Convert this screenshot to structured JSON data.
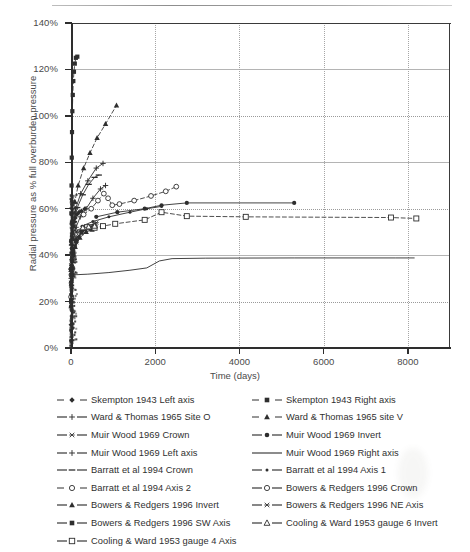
{
  "chart_data": {
    "type": "line",
    "title": "",
    "xlabel": "Time (days)",
    "ylabel": "Radial pressure as % full overburden pressure",
    "xlim": [
      0,
      9000
    ],
    "ylim": [
      0,
      1.4
    ],
    "xticks": [
      "0",
      "2000",
      "4000",
      "6000",
      "8000"
    ],
    "xtick_values": [
      0,
      2000,
      4000,
      6000,
      8000
    ],
    "yticks": [
      "0%",
      "20%",
      "40%",
      "60%",
      "80%",
      "100%",
      "120%",
      "140%"
    ],
    "ytick_values": [
      0,
      0.2,
      0.4,
      0.6,
      0.8,
      1.0,
      1.2,
      1.4
    ],
    "grid": "both-dotted",
    "legend_position": "below-plot-two-columns",
    "series": [
      {
        "name": "Skempton 1943 Left axis",
        "marker": "diamond-filled",
        "line": "dashed",
        "points": [
          [
            2,
            0.1
          ],
          [
            4,
            0.18
          ],
          [
            7,
            0.27
          ],
          [
            10,
            0.33
          ],
          [
            14,
            0.38
          ],
          [
            20,
            0.43
          ],
          [
            28,
            0.47
          ],
          [
            40,
            0.5
          ],
          [
            55,
            0.525
          ],
          [
            75,
            0.545
          ],
          [
            100,
            0.56
          ],
          [
            140,
            0.575
          ],
          [
            190,
            0.585
          ],
          [
            250,
            0.59
          ],
          [
            330,
            0.6
          ]
        ]
      },
      {
        "name": "Skempton 1943 Right axis",
        "marker": "square-filled",
        "line": "dashed",
        "points": [
          [
            2,
            0.2
          ],
          [
            4,
            0.34
          ],
          [
            6,
            0.46
          ],
          [
            9,
            0.58
          ],
          [
            13,
            0.7
          ],
          [
            18,
            0.82
          ],
          [
            24,
            0.93
          ],
          [
            32,
            1.02
          ],
          [
            42,
            1.09
          ],
          [
            55,
            1.15
          ],
          [
            70,
            1.19
          ],
          [
            90,
            1.225
          ],
          [
            115,
            1.25
          ],
          [
            150,
            1.255
          ]
        ]
      },
      {
        "name": "Ward & Thomas 1965 Site O",
        "marker": "plus",
        "line": "solid",
        "points": [
          [
            5,
            0.3
          ],
          [
            20,
            0.4
          ],
          [
            60,
            0.47
          ],
          [
            120,
            0.52
          ],
          [
            220,
            0.565
          ],
          [
            360,
            0.6
          ],
          [
            520,
            0.645
          ],
          [
            700,
            0.685
          ],
          [
            820,
            0.7
          ]
        ]
      },
      {
        "name": "Ward & Thomas 1965 site V",
        "marker": "triangle-filled",
        "line": "dashed",
        "points": [
          [
            10,
            0.45
          ],
          [
            40,
            0.55
          ],
          [
            90,
            0.63
          ],
          [
            170,
            0.7
          ],
          [
            300,
            0.775
          ],
          [
            450,
            0.84
          ],
          [
            620,
            0.905
          ],
          [
            820,
            0.965
          ],
          [
            1080,
            1.045
          ]
        ]
      },
      {
        "name": "Muir Wood 1969 Crown",
        "marker": "asterisk",
        "line": "solid",
        "points": [
          [
            3,
            0.28
          ],
          [
            12,
            0.355
          ],
          [
            35,
            0.405
          ],
          [
            80,
            0.445
          ],
          [
            160,
            0.48
          ],
          [
            280,
            0.505
          ],
          [
            430,
            0.525
          ],
          [
            600,
            0.54
          ]
        ]
      },
      {
        "name": "Muir Wood 1969 Invert",
        "marker": "circle-filled",
        "line": "solid",
        "points": [
          [
            600,
            0.565
          ],
          [
            1100,
            0.585
          ],
          [
            1750,
            0.6
          ],
          [
            2150,
            0.615
          ],
          [
            2750,
            0.625
          ],
          [
            5300,
            0.625
          ]
        ]
      },
      {
        "name": "Muir Wood 1969 Left axis",
        "marker": "plus",
        "line": "solid",
        "points": [
          [
            3,
            0.33
          ],
          [
            15,
            0.445
          ],
          [
            45,
            0.53
          ],
          [
            110,
            0.6
          ],
          [
            230,
            0.665
          ],
          [
            400,
            0.72
          ],
          [
            600,
            0.775
          ],
          [
            760,
            0.795
          ]
        ]
      },
      {
        "name": "Muir Wood 1969 Right axis",
        "marker": "none",
        "line": "solid",
        "points": [
          [
            30,
            0.315
          ],
          [
            400,
            0.318
          ],
          [
            900,
            0.325
          ],
          [
            1400,
            0.335
          ],
          [
            1800,
            0.345
          ],
          [
            2100,
            0.375
          ],
          [
            2400,
            0.385
          ],
          [
            3200,
            0.387
          ],
          [
            5300,
            0.388
          ],
          [
            7700,
            0.388
          ],
          [
            8150,
            0.388
          ]
        ]
      },
      {
        "name": "Barratt et al 1994 Crown",
        "marker": "dash",
        "line": "solid",
        "points": [
          [
            5,
            0.34
          ],
          [
            25,
            0.46
          ],
          [
            70,
            0.545
          ],
          [
            150,
            0.605
          ],
          [
            280,
            0.66
          ],
          [
            420,
            0.705
          ],
          [
            560,
            0.735
          ],
          [
            660,
            0.745
          ]
        ]
      },
      {
        "name": "Barratt et al 1994 Axis 1",
        "marker": "dot-small",
        "line": "solid",
        "points": [
          [
            260,
            0.525
          ],
          [
            520,
            0.545
          ],
          [
            900,
            0.565
          ],
          [
            1400,
            0.585
          ],
          [
            1800,
            0.6
          ],
          [
            2150,
            0.61
          ]
        ]
      },
      {
        "name": "Barratt et al 1994 Axis 2",
        "marker": "circle-open",
        "line": "dashed",
        "points": [
          [
            300,
            0.575
          ],
          [
            480,
            0.6
          ],
          [
            640,
            0.635
          ],
          [
            780,
            0.665
          ],
          [
            880,
            0.645
          ],
          [
            980,
            0.615
          ],
          [
            1150,
            0.62
          ],
          [
            1500,
            0.635
          ],
          [
            1900,
            0.655
          ],
          [
            2250,
            0.675
          ],
          [
            2500,
            0.695
          ]
        ]
      },
      {
        "name": "Bowers & Redgers 1996 Crown",
        "marker": "circle-open",
        "line": "solid",
        "points": [
          [
            2,
            0.22
          ],
          [
            10,
            0.315
          ],
          [
            35,
            0.4
          ],
          [
            90,
            0.455
          ],
          [
            200,
            0.495
          ],
          [
            340,
            0.515
          ],
          [
            480,
            0.52
          ]
        ]
      },
      {
        "name": "Bowers & Redgers 1996 Invert",
        "marker": "triangle-filled",
        "line": "solid",
        "points": [
          [
            2,
            0.18
          ],
          [
            12,
            0.29
          ],
          [
            40,
            0.375
          ],
          [
            100,
            0.435
          ],
          [
            210,
            0.475
          ],
          [
            360,
            0.5
          ],
          [
            500,
            0.51
          ]
        ]
      },
      {
        "name": "Bowers & Redgers 1996 NE Axis",
        "marker": "asterisk",
        "line": "solid",
        "points": [
          [
            3,
            0.2
          ],
          [
            15,
            0.31
          ],
          [
            50,
            0.4
          ],
          [
            120,
            0.455
          ],
          [
            240,
            0.495
          ],
          [
            400,
            0.515
          ],
          [
            540,
            0.525
          ]
        ]
      },
      {
        "name": "Bowers & Redgers 1996 SW Axis",
        "marker": "square-filled",
        "line": "solid",
        "points": [
          [
            3,
            0.205
          ],
          [
            16,
            0.315
          ],
          [
            52,
            0.405
          ],
          [
            125,
            0.46
          ],
          [
            250,
            0.5
          ],
          [
            410,
            0.52
          ],
          [
            560,
            0.528
          ]
        ]
      },
      {
        "name": "Cooling & Ward 1953 gauge 4 Axis",
        "marker": "square-open",
        "line": "dashed",
        "points": [
          [
            380,
            0.52
          ],
          [
            560,
            0.518
          ],
          [
            760,
            0.525
          ],
          [
            1050,
            0.535
          ],
          [
            1750,
            0.552
          ],
          [
            2150,
            0.585
          ],
          [
            2750,
            0.568
          ],
          [
            4150,
            0.565
          ],
          [
            7600,
            0.562
          ],
          [
            8200,
            0.558
          ]
        ]
      },
      {
        "name": "Cooling & Ward 1953 gauge 6 Invert",
        "marker": "triangle-open",
        "line": "solid",
        "points": [
          [
            120,
            0.505
          ],
          [
            280,
            0.518
          ],
          [
            420,
            0.522
          ],
          [
            560,
            0.525
          ]
        ]
      }
    ]
  },
  "axes": {
    "y_title": "Radial pressure as % full overburden pressure",
    "x_title": "Time (days)",
    "ytick_labels": [
      "140%",
      "120%",
      "100%",
      "80%",
      "60%",
      "40%",
      "20%",
      "0%"
    ],
    "xtick_labels": [
      "0",
      "2000",
      "4000",
      "6000",
      "8000"
    ]
  },
  "legend": {
    "left_column": [
      {
        "label": "Skempton 1943 Left axis",
        "key": "dashed-diamond-filled"
      },
      {
        "label": "Ward & Thomas 1965 Site O",
        "key": "solid-plus"
      },
      {
        "label": "Muir Wood 1969 Crown",
        "key": "solid-asterisk"
      },
      {
        "label": "Muir Wood 1969 Left axis",
        "key": "solid-plus"
      },
      {
        "label": "Barratt et al 1994 Crown",
        "key": "solid-dash"
      },
      {
        "label": "Barratt et al 1994 Axis 2",
        "key": "dashed-circle-open"
      },
      {
        "label": "Bowers & Redgers 1996 Invert",
        "key": "solid-triangle-filled"
      },
      {
        "label": "Bowers & Redgers 1996 SW Axis",
        "key": "solid-square-filled"
      },
      {
        "label": "Cooling & Ward 1953 gauge 4 Axis",
        "key": "solid-square-open"
      }
    ],
    "right_column": [
      {
        "label": "Skempton 1943 Right axis",
        "key": "dashed-square-filled"
      },
      {
        "label": "Ward & Thomas 1965 site V",
        "key": "dashed-triangle-filled"
      },
      {
        "label": "Muir Wood 1969 Invert",
        "key": "solid-circle-filled"
      },
      {
        "label": "Muir Wood 1969 Right axis",
        "key": "solid-plain"
      },
      {
        "label": "Barratt et al 1994 Axis 1",
        "key": "solid-dot-small"
      },
      {
        "label": "Bowers & Redgers 1996 Crown",
        "key": "solid-circle-open"
      },
      {
        "label": "Bowers & Redgers 1996 NE Axis",
        "key": "solid-asterisk"
      },
      {
        "label": "Cooling & Ward 1953 gauge 6 Invert",
        "key": "solid-triangle-open"
      }
    ]
  },
  "colors": {
    "ink": "#2e2e2e",
    "axis": "#3a3a3a",
    "grid": "#9a9a9a",
    "background": "#ffffff"
  }
}
